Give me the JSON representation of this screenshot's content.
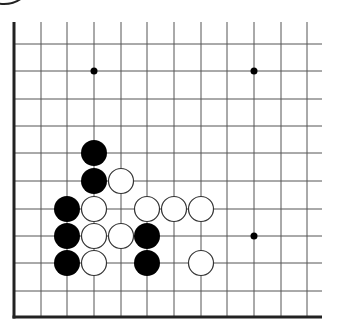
{
  "diagram": {
    "type": "go-board-fragment",
    "colors": {
      "background": "#ffffff",
      "grid_line": "#555555",
      "edge_line": "#222222",
      "black_stone": "#000000",
      "white_stone_fill": "#ffffff",
      "white_stone_stroke": "#333333",
      "hoshi": "#000000"
    },
    "grid": {
      "columns_x": [
        14,
        41,
        67,
        94,
        121,
        147,
        174,
        201,
        227,
        254,
        281,
        307
      ],
      "rows_y": [
        44,
        71,
        99,
        126,
        153,
        181,
        209,
        236,
        263,
        291,
        317
      ],
      "top_y": 22,
      "right_x": 322,
      "left_edge_col": 0,
      "bottom_edge_row": 10
    },
    "stone_radius": 13,
    "hoshi": [
      {
        "col": 3,
        "row": 1
      },
      {
        "col": 9,
        "row": 1
      },
      {
        "col": 9,
        "row": 7
      }
    ],
    "stones": [
      {
        "color": "black",
        "col": 3,
        "row": 4
      },
      {
        "color": "black",
        "col": 3,
        "row": 5
      },
      {
        "color": "white",
        "col": 4,
        "row": 5
      },
      {
        "color": "black",
        "col": 2,
        "row": 6
      },
      {
        "color": "white",
        "col": 3,
        "row": 6
      },
      {
        "color": "white",
        "col": 5,
        "row": 6
      },
      {
        "color": "white",
        "col": 6,
        "row": 6
      },
      {
        "color": "white",
        "col": 7,
        "row": 6
      },
      {
        "color": "black",
        "col": 2,
        "row": 7
      },
      {
        "color": "white",
        "col": 3,
        "row": 7
      },
      {
        "color": "white",
        "col": 4,
        "row": 7
      },
      {
        "color": "black",
        "col": 5,
        "row": 7
      },
      {
        "color": "black",
        "col": 2,
        "row": 8
      },
      {
        "color": "white",
        "col": 3,
        "row": 8
      },
      {
        "color": "black",
        "col": 5,
        "row": 8
      },
      {
        "color": "white",
        "col": 7,
        "row": 8
      }
    ],
    "corner_arc": {
      "cx": 4,
      "cy": -14,
      "rx": 24,
      "ry": 18
    }
  }
}
